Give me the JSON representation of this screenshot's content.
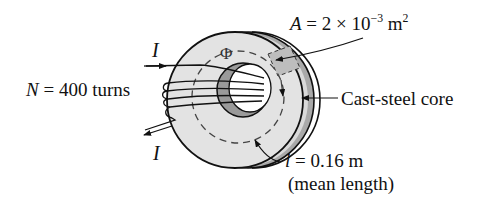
{
  "diagram": {
    "labels": {
      "current_top": {
        "symbol": "I"
      },
      "current_bottom": {
        "symbol": "I"
      },
      "turns": {
        "symbol": "N",
        "equals": "=",
        "value": "400 turns"
      },
      "flux": {
        "symbol": "Φ"
      },
      "area": {
        "symbol": "A",
        "equals": "=",
        "mantissa": "2",
        "times": "×",
        "base": "10",
        "exponent": "−3",
        "unit": "m",
        "unit_exponent": "2"
      },
      "core": {
        "text": "Cast-steel core"
      },
      "length": {
        "symbol": "l",
        "equals": "=",
        "value": "0.16 m",
        "note": "(mean length)"
      }
    },
    "colors": {
      "ink": "#111111",
      "face_fill": "#e3e3e3",
      "rim_fill": "#a9a9a9",
      "inner_shadow": "#9a9a9a",
      "cross_section_fill": "#bdbdbd",
      "background": "#ffffff"
    }
  }
}
